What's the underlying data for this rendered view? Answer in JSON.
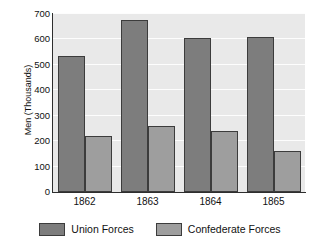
{
  "chart_data": {
    "type": "bar",
    "title": "",
    "xlabel": "",
    "ylabel": "Men (Thousands)",
    "categories": [
      "1862",
      "1863",
      "1864",
      "1865"
    ],
    "series": [
      {
        "name": "Union Forces",
        "color": "#7d7d7d",
        "values": [
          533,
          677,
          605,
          611
        ]
      },
      {
        "name": "Confederate Forces",
        "color": "#9e9e9e",
        "values": [
          222,
          261,
          240,
          160
        ]
      }
    ],
    "ylim": [
      0,
      700
    ],
    "yticks": [
      0,
      100,
      200,
      300,
      400,
      500,
      600,
      700
    ],
    "ytick_labels": [
      "0",
      "100",
      "200",
      "300",
      "400",
      "500",
      "600",
      "700"
    ],
    "grid": true,
    "grid_axis": "y",
    "legend_position": "bottom",
    "plot_background": "#e9e9e9",
    "gridline_color": "#fdfdfd"
  },
  "legend": {
    "entries": [
      {
        "label": "Union Forces"
      },
      {
        "label": "Confederate Forces"
      }
    ]
  }
}
